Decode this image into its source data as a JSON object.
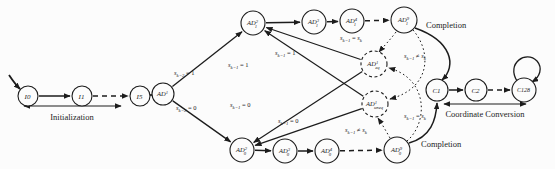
{
  "diagram": {
    "width": 555,
    "height": 169,
    "background": "#fcfcfc",
    "ink_color": "#1c1c1c",
    "nodes": [
      {
        "id": "I0",
        "x": 28,
        "y": 96,
        "r": 10,
        "fs": 7,
        "label": [
          {
            "t": "I0",
            "f": "i"
          }
        ]
      },
      {
        "id": "I1",
        "x": 82,
        "y": 96,
        "r": 10,
        "fs": 7,
        "label": [
          {
            "t": "I1",
            "f": "i"
          }
        ]
      },
      {
        "id": "I5",
        "x": 140,
        "y": 96,
        "r": 10,
        "fs": 7,
        "label": [
          {
            "t": "I5",
            "f": "i"
          }
        ]
      },
      {
        "id": "AD1",
        "x": 163,
        "y": 94,
        "r": 11,
        "fs": 6.5,
        "label": [
          {
            "t": "AD",
            "f": "i"
          },
          {
            "t": "1",
            "f": "sup"
          }
        ]
      },
      {
        "id": "AD12",
        "x": 253,
        "y": 23,
        "r": 12,
        "fs": 6.5,
        "label": [
          {
            "t": "AD",
            "f": "i"
          },
          {
            "t": "2",
            "f": "sup"
          },
          {
            "t": "1",
            "f": "sub",
            "dx": -3.2
          }
        ]
      },
      {
        "id": "AD13",
        "x": 314,
        "y": 22,
        "r": 12,
        "fs": 6.5,
        "label": [
          {
            "t": "AD",
            "f": "i"
          },
          {
            "t": "3",
            "f": "sup"
          },
          {
            "t": "1",
            "f": "sub",
            "dx": -3.2
          }
        ]
      },
      {
        "id": "AD14",
        "x": 352,
        "y": 21,
        "r": 12,
        "fs": 6.5,
        "label": [
          {
            "t": "AD",
            "f": "i"
          },
          {
            "t": "4",
            "f": "sup"
          },
          {
            "t": "1",
            "f": "sub",
            "dx": -3.2
          }
        ]
      },
      {
        "id": "AD19",
        "x": 404,
        "y": 20,
        "r": 13,
        "fs": 6.5,
        "label": [
          {
            "t": "AD",
            "f": "i"
          },
          {
            "t": "9",
            "f": "sup"
          },
          {
            "t": "1",
            "f": "sub",
            "dx": -3.2
          }
        ]
      },
      {
        "id": "AD02",
        "x": 242,
        "y": 150,
        "r": 12,
        "fs": 6.5,
        "label": [
          {
            "t": "AD",
            "f": "i"
          },
          {
            "t": "2",
            "f": "sup"
          },
          {
            "t": "0",
            "f": "sub",
            "dx": -3.2
          }
        ]
      },
      {
        "id": "AD03",
        "x": 285,
        "y": 151,
        "r": 12,
        "fs": 6.5,
        "label": [
          {
            "t": "AD",
            "f": "i"
          },
          {
            "t": "3",
            "f": "sup"
          },
          {
            "t": "0",
            "f": "sub",
            "dx": -3.2
          }
        ]
      },
      {
        "id": "AD04",
        "x": 327,
        "y": 151,
        "r": 12,
        "fs": 6.5,
        "label": [
          {
            "t": "AD",
            "f": "i"
          },
          {
            "t": "4",
            "f": "sup"
          },
          {
            "t": "0",
            "f": "sub",
            "dx": -3.2
          }
        ]
      },
      {
        "id": "AD09",
        "x": 397,
        "y": 150,
        "r": 13,
        "fs": 6.5,
        "label": [
          {
            "t": "AD",
            "f": "i"
          },
          {
            "t": "9",
            "f": "sup"
          },
          {
            "t": "0",
            "f": "sub",
            "dx": -3.2
          }
        ]
      },
      {
        "id": "ADeq",
        "x": 374,
        "y": 64,
        "r": 13,
        "fs": 6.5,
        "dashed": true,
        "label": [
          {
            "t": "AD",
            "f": "i"
          },
          {
            "t": "1",
            "f": "sup"
          },
          {
            "t": "eq",
            "f": "sub",
            "dx": -3
          }
        ]
      },
      {
        "id": "ADuneq",
        "x": 375,
        "y": 104,
        "r": 13,
        "fs": 6.5,
        "dashed": true,
        "label": [
          {
            "t": "AD",
            "f": "i"
          },
          {
            "t": "1",
            "f": "sup"
          },
          {
            "t": "uneq",
            "f": "sub",
            "dx": -3
          }
        ]
      },
      {
        "id": "C1",
        "x": 437,
        "y": 90,
        "r": 11,
        "fs": 7,
        "label": [
          {
            "t": "C1",
            "f": "i"
          }
        ]
      },
      {
        "id": "C2",
        "x": 476,
        "y": 90,
        "r": 11,
        "fs": 7,
        "label": [
          {
            "t": "C2",
            "f": "i"
          }
        ]
      },
      {
        "id": "C128",
        "x": 524,
        "y": 90,
        "r": 12,
        "fs": 6,
        "label": [
          {
            "t": "C128",
            "f": "i"
          }
        ]
      }
    ],
    "edges": [
      {
        "id": "start-arrow",
        "path": "M 9,75 C 13,81 16,85 20,89",
        "w": 1.8
      },
      {
        "id": "i0-i1",
        "from": "I0",
        "to": "I1",
        "w": 1.5
      },
      {
        "id": "i1-i5",
        "from": "I1",
        "to": "I5",
        "type": "dashed",
        "w": 1.5
      },
      {
        "id": "i5-ad1",
        "from": "I5",
        "to": "AD1",
        "w": 1.5
      },
      {
        "id": "ad1-ad12",
        "from": "AD1",
        "to": "AD12",
        "w": 1.3
      },
      {
        "id": "ad1-ad02",
        "from": "AD1",
        "to": "AD02",
        "w": 1.3
      },
      {
        "id": "ad12-ad13",
        "from": "AD12",
        "to": "AD13",
        "w": 1.5
      },
      {
        "id": "ad13-ad14",
        "from": "AD13",
        "to": "AD14",
        "w": 1.5
      },
      {
        "id": "ad14-ad19",
        "from": "AD14",
        "to": "AD19",
        "type": "dashed",
        "w": 1.5
      },
      {
        "id": "ad02-ad03",
        "from": "AD02",
        "to": "AD03",
        "w": 1.5
      },
      {
        "id": "ad03-ad04",
        "from": "AD03",
        "to": "AD04",
        "w": 1.5
      },
      {
        "id": "ad04-ad09",
        "from": "AD04",
        "to": "AD09",
        "type": "dashed",
        "w": 1.5
      },
      {
        "id": "adeq-ad12",
        "from": "ADeq",
        "to": "AD12",
        "w": 1.2
      },
      {
        "id": "adeq-ad02",
        "from": "ADeq",
        "to": "AD02",
        "w": 1.2
      },
      {
        "id": "aduneq-ad12",
        "from": "ADuneq",
        "to": "AD12",
        "w": 1.2
      },
      {
        "id": "aduneq-ad02",
        "from": "ADuneq",
        "to": "AD02",
        "w": 1.2
      },
      {
        "id": "ad19-adeq",
        "path": "M 396,32 C 390,40 384,46 379,52",
        "type": "dotted",
        "w": 1
      },
      {
        "id": "ad09-aduneq",
        "path": "M 390,138 C 386,131 382,124 378,118",
        "type": "dotted",
        "w": 1
      },
      {
        "id": "ad19-aduneq",
        "path": "M 413,30 C 432,52 431,88 390,99",
        "type": "dotted",
        "w": 1
      },
      {
        "id": "ad09-adeq",
        "path": "M 407,141 C 428,123 429,79 389,68",
        "type": "dotted",
        "w": 1
      },
      {
        "id": "completion-top",
        "path": "M 415,28 C 452,41 457,66 442,80",
        "w": 1.5
      },
      {
        "id": "completion-bottom",
        "path": "M 409,143 C 431,137 436,120 437,103",
        "w": 1.5
      },
      {
        "id": "c1-c2",
        "from": "C1",
        "to": "C2",
        "w": 1.5
      },
      {
        "id": "c2-c128",
        "from": "C2",
        "to": "C128",
        "type": "dashed",
        "w": 1.5
      },
      {
        "id": "c128-self-loop",
        "path": "M 517,81 C 506,63 526,50 537,61 C 543,68 540,77 532,82",
        "w": 1.3
      }
    ],
    "edge_labels": [
      {
        "id": "sk2-eq-1",
        "x": 174,
        "y": 75,
        "seg": [
          {
            "t": "s",
            "f": "i"
          },
          {
            "t": "k−2",
            "f": "sub"
          },
          {
            "t": " = 1",
            "f": "n"
          }
        ]
      },
      {
        "id": "sk2-eq-0",
        "x": 176,
        "y": 110,
        "seg": [
          {
            "t": "s",
            "f": "i"
          },
          {
            "t": "k−2",
            "f": "sub"
          },
          {
            "t": " = 0",
            "f": "n"
          }
        ]
      },
      {
        "id": "sk1-eq-1-left",
        "x": 228,
        "y": 67,
        "seg": [
          {
            "t": "s",
            "f": "i"
          },
          {
            "t": "k−1",
            "f": "sub"
          },
          {
            "t": " = 1",
            "f": "n"
          }
        ]
      },
      {
        "id": "sk1-eq-1-mid",
        "x": 275,
        "y": 55,
        "seg": [
          {
            "t": "s",
            "f": "i"
          },
          {
            "t": "k−1",
            "f": "sub"
          },
          {
            "t": " = 1",
            "f": "n"
          }
        ]
      },
      {
        "id": "sk1-eq-0-left",
        "x": 230,
        "y": 107,
        "seg": [
          {
            "t": "s",
            "f": "i"
          },
          {
            "t": "k−1",
            "f": "sub"
          },
          {
            "t": " = 0",
            "f": "n"
          }
        ]
      },
      {
        "id": "sk1-eq-0-mid",
        "x": 278,
        "y": 123,
        "seg": [
          {
            "t": "s",
            "f": "i"
          },
          {
            "t": "k−1",
            "f": "sub"
          },
          {
            "t": " = 0",
            "f": "n"
          }
        ]
      },
      {
        "id": "sk1-eq-sk-top",
        "x": 340,
        "y": 40,
        "seg": [
          {
            "t": "s",
            "f": "i"
          },
          {
            "t": "k−1",
            "f": "sub"
          },
          {
            "t": " = ",
            "f": "n"
          },
          {
            "t": "s",
            "f": "i"
          },
          {
            "t": "k",
            "f": "sub"
          }
        ]
      },
      {
        "id": "sk1-neq-sk-top",
        "x": 404,
        "y": 58,
        "seg": [
          {
            "t": "s",
            "f": "i"
          },
          {
            "t": "k−1",
            "f": "sub"
          },
          {
            "t": " ≠ ",
            "f": "n"
          },
          {
            "t": "s",
            "f": "i"
          },
          {
            "t": "k",
            "f": "sub"
          }
        ]
      },
      {
        "id": "sk1-neq-sk-bot",
        "x": 345,
        "y": 132,
        "seg": [
          {
            "t": "s",
            "f": "i"
          },
          {
            "t": "k−1",
            "f": "sub"
          },
          {
            "t": " ≠ ",
            "f": "n"
          },
          {
            "t": "s",
            "f": "i"
          },
          {
            "t": "k",
            "f": "sub"
          }
        ]
      },
      {
        "id": "sk1-eq-sk-bot",
        "x": 404,
        "y": 118,
        "seg": [
          {
            "t": "s",
            "f": "i"
          },
          {
            "t": "k−1",
            "f": "sub"
          },
          {
            "t": " = ",
            "f": "n"
          },
          {
            "t": "s",
            "f": "i"
          },
          {
            "t": "k",
            "f": "sub"
          }
        ]
      }
    ],
    "annotations": {
      "initialization": {
        "label": "Initialization",
        "text_x": 72,
        "text_y": 120,
        "arrow": {
          "x1": 24,
          "x2": 121,
          "y": 106
        }
      },
      "coordinate_conversion": {
        "label": "Coordinate Conversion",
        "text_x": 485,
        "text_y": 117,
        "arrow": {
          "x1": 444,
          "x2": 526,
          "y": 104
        }
      },
      "completion_top": {
        "label": "Completion",
        "text_x": 426,
        "text_y": 28
      },
      "completion_bottom": {
        "label": "Completion",
        "text_x": 421,
        "text_y": 147
      }
    }
  }
}
